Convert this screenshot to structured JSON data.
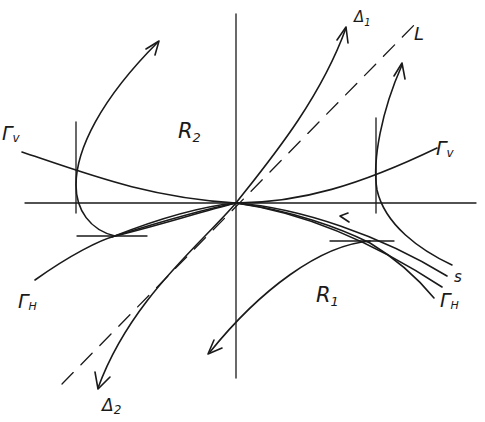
{
  "figure": {
    "type": "phase-portrait",
    "background": "#ffffff",
    "ink_color": "#1a1a1a"
  },
  "labels": {
    "delta1": "Δ",
    "delta1_sub": "1",
    "delta2": "Δ",
    "delta2_sub": "2",
    "L": "L",
    "gamma_v_left": "Γ",
    "gamma_v_left_sub": "v",
    "gamma_v_right": "Γ",
    "gamma_v_right_sub": "v",
    "gamma_h_left": "Γ",
    "gamma_h_left_sub": "H",
    "gamma_h_right": "Γ",
    "gamma_h_right_sub": "H",
    "R1": "R",
    "R1_sub": "1",
    "R2": "R",
    "R2_sub": "2",
    "S": "s"
  },
  "elements": {
    "axes": [
      "horizontal-axis",
      "vertical-axis"
    ],
    "dashed_line": "L",
    "separatrices": [
      "Δ1",
      "Δ2"
    ],
    "isoclines": [
      "Γv (vertical isocline)",
      "ΓH (horizontal isocline)"
    ],
    "regions": [
      "R1",
      "R2"
    ],
    "special_trajectory": "S"
  }
}
